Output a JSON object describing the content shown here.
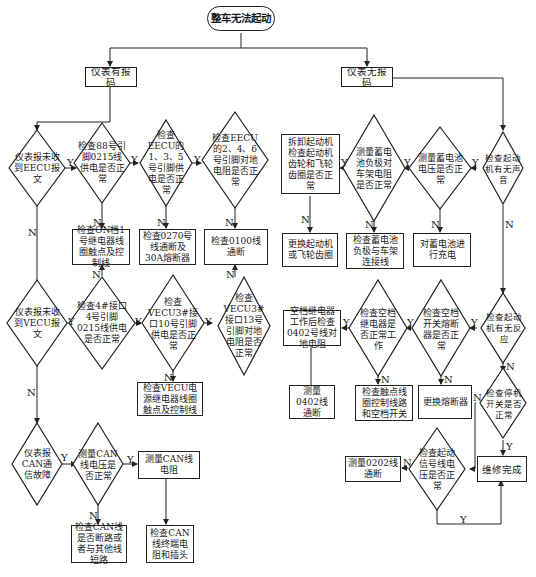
{
  "title": "整车无法起动",
  "branches": {
    "left": "仪表有报码",
    "right": "仪表无报码"
  },
  "nodes": {
    "d_eecu_msg": "仪表报未收到EECU报文",
    "d_88_0215": "检查88号引脚0215线供电是否正常",
    "d_eecu_135": "检查EECU的1、3、5号引脚供电是否正常",
    "d_eecu_246": "检查EECU的2、4、6号引脚对地电阻是否正常",
    "b_on_relay": "检查ON档1号继电器线圈触点及控制线",
    "b_0270": "检查0270号线通断及30A熔断器",
    "b_0100": "检查0100线通断",
    "d_vecu_msg": "仪表报未收到VECU报文",
    "d_4_0215": "检查4#接口4号引脚0215线供电是否正常",
    "d_vecu_10": "检查VECU3#接口10号引脚供电是否正常",
    "d_vecu_13": "检查VECU3#接口13号引脚对地电阻是否正常",
    "b_vecu_relay": "检查VECU电源继电器线圈触点及控制线",
    "d_can_fault": "仪表报CAN通信故障",
    "d_can_volt": "测量CAN线电压是否正常",
    "b_can_res": "测量CAN线电阻",
    "b_can_short": "检查CAN线是否断路或者与其他线短路",
    "b_can_term": "检查CAN线终端电阻和插头",
    "b_starter_gear": "拆卸起动机检查起动机齿轮和飞轮齿圈是否正常",
    "d_batt_neg": "测量蓄电池负极对车架电阻是否正常",
    "d_batt_volt": "测量蓄电池电压是否正常",
    "d_starter_sound": "检查起动机有无声音",
    "b_replace_starter": "更换起动机或飞轮齿圈",
    "b_batt_neg_link": "检查蓄电池负极与车架连接线",
    "b_charge": "对蓄电池进行充电",
    "b_0402_res": "空档继电器工作后检查0402号线对地电阻",
    "d_neutral_relay": "检查空档继电器是否正常工作",
    "d_neutral_fuse": "检查空档开关熔断器是否正常",
    "d_starter_react": "检查起动机有无反应",
    "b_0402_cont": "测量0402线通断",
    "b_contact_coil": "检查触点线圈控制线路和空档开关",
    "b_replace_fuse": "更换熔断器",
    "d_stop_switch": "检查停机开关是否正常",
    "b_0202_cont": "测量0202线通断",
    "d_start_signal": "检查起动信号线电压是否正常",
    "b_done": "维修完成"
  },
  "edge_labels": {
    "yes": "Y",
    "no": "N"
  },
  "colors": {
    "line": "#222222",
    "background": "#ffffff"
  }
}
